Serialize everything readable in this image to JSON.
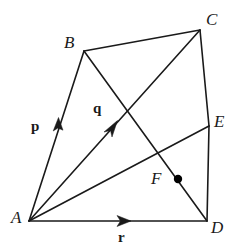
{
  "figure": {
    "background_color": "#ffffff",
    "stroke_color": "#1a1a1a",
    "width": 249,
    "height": 251,
    "vertices": [
      {
        "id": "A",
        "label": "A",
        "x": 29,
        "y": 221,
        "label_x": 11,
        "label_y": 212
      },
      {
        "id": "B",
        "label": "B",
        "x": 84,
        "y": 51,
        "label_x": 64,
        "label_y": 36
      },
      {
        "id": "C",
        "label": "C",
        "x": 200,
        "y": 30,
        "label_x": 206,
        "label_y": 13
      },
      {
        "id": "D",
        "label": "D",
        "x": 207,
        "y": 221,
        "label_x": 211,
        "label_y": 219
      },
      {
        "id": "E",
        "label": "E",
        "x": 209,
        "y": 126,
        "label_x": 214,
        "label_y": 113
      },
      {
        "id": "F",
        "label": "F",
        "x": 178,
        "y": 179,
        "label_x": 152,
        "label_y": 171
      }
    ],
    "marked_point": {
      "id": "F-dot",
      "x": 178,
      "y": 179,
      "radius": 4.2
    },
    "edges": [
      {
        "id": "AB",
        "from": "A",
        "to": "B"
      },
      {
        "id": "BC",
        "from": "B",
        "to": "C"
      },
      {
        "id": "CE",
        "from": "C",
        "to": "E"
      },
      {
        "id": "ED",
        "from": "E",
        "to": "D"
      },
      {
        "id": "AD",
        "from": "A",
        "to": "D"
      }
    ],
    "diagonals": [
      {
        "id": "AC",
        "from": "A",
        "to": "C"
      },
      {
        "id": "BD",
        "from": "B",
        "to": "D"
      },
      {
        "id": "AE",
        "from": "A",
        "to": "E"
      }
    ],
    "vectors": [
      {
        "id": "p",
        "label": "p",
        "along": "AB",
        "label_x": 31,
        "label_y": 119,
        "arrow_x": 58,
        "arrow_y": 126
      },
      {
        "id": "q",
        "label": "q",
        "along": "AC",
        "label_x": 93,
        "label_y": 101,
        "arrow_x": 113,
        "arrow_y": 126
      },
      {
        "id": "r",
        "label": "r",
        "along": "AD",
        "label_x": 118,
        "label_y": 230,
        "arrow_x": 124,
        "arrow_y": 221
      }
    ]
  }
}
